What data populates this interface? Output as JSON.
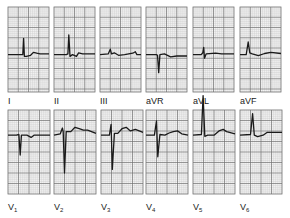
{
  "colors": {
    "paper": "#f4f4f4",
    "minor_grid": "#c8c8c8",
    "major_grid": "#6e6e6e",
    "trace": "#1a1a1a",
    "label": "#222222"
  },
  "rows": [
    {
      "leads": [
        {
          "id": "I",
          "label": "I",
          "sub": ""
        },
        {
          "id": "II",
          "label": "II",
          "sub": ""
        },
        {
          "id": "III",
          "label": "III",
          "sub": ""
        },
        {
          "id": "aVR",
          "label": "aVR",
          "sub": ""
        },
        {
          "id": "aVL",
          "label": "aVL",
          "sub": ""
        },
        {
          "id": "aVF",
          "label": "aVF",
          "sub": ""
        }
      ]
    },
    {
      "leads": [
        {
          "id": "V1",
          "label": "V",
          "sub": "1"
        },
        {
          "id": "V2",
          "label": "V",
          "sub": "2"
        },
        {
          "id": "V3",
          "label": "V",
          "sub": "3"
        },
        {
          "id": "V4",
          "label": "V",
          "sub": "4"
        },
        {
          "id": "V5",
          "label": "V",
          "sub": "5"
        },
        {
          "id": "V6",
          "label": "V",
          "sub": "6"
        }
      ]
    }
  ],
  "waveforms": {
    "I": [
      [
        0,
        0
      ],
      [
        0.3,
        0
      ],
      [
        0.36,
        0
      ],
      [
        0.38,
        0.45
      ],
      [
        0.4,
        -0.05
      ],
      [
        0.45,
        -0.05
      ],
      [
        0.55,
        -0.02
      ],
      [
        0.62,
        0.06
      ],
      [
        0.7,
        0.04
      ],
      [
        0.78,
        0.02
      ],
      [
        1,
        0.02
      ]
    ],
    "II": [
      [
        0,
        0
      ],
      [
        0.3,
        0
      ],
      [
        0.34,
        0.02
      ],
      [
        0.36,
        0.55
      ],
      [
        0.39,
        -0.05
      ],
      [
        0.45,
        0
      ],
      [
        0.55,
        -0.05
      ],
      [
        0.6,
        0.05
      ],
      [
        0.7,
        0.02
      ],
      [
        1,
        0.02
      ]
    ],
    "III": [
      [
        0,
        0
      ],
      [
        0.2,
        0.02
      ],
      [
        0.25,
        0.15
      ],
      [
        0.28,
        0.02
      ],
      [
        0.35,
        0.05
      ],
      [
        0.45,
        -0.02
      ],
      [
        0.6,
        0
      ],
      [
        0.8,
        0.04
      ],
      [
        0.86,
        0.08
      ],
      [
        0.9,
        0
      ],
      [
        1,
        0
      ]
    ],
    "aVR": [
      [
        0,
        0
      ],
      [
        0.25,
        0
      ],
      [
        0.28,
        -0.02
      ],
      [
        0.31,
        -0.5
      ],
      [
        0.34,
        0
      ],
      [
        0.45,
        0.02
      ],
      [
        0.6,
        -0.06
      ],
      [
        0.75,
        -0.04
      ],
      [
        1,
        -0.04
      ]
    ],
    "aVL": [
      [
        0,
        0
      ],
      [
        0.2,
        0
      ],
      [
        0.24,
        0.05
      ],
      [
        0.26,
        0.2
      ],
      [
        0.28,
        -0.1
      ],
      [
        0.32,
        0.02
      ],
      [
        0.55,
        0.04
      ],
      [
        0.7,
        0.02
      ],
      [
        1,
        0.02
      ]
    ],
    "aVF": [
      [
        0,
        0
      ],
      [
        0.15,
        0
      ],
      [
        0.2,
        0.35
      ],
      [
        0.24,
        0.05
      ],
      [
        0.3,
        0.02
      ],
      [
        0.45,
        -0.03
      ],
      [
        0.6,
        0.03
      ],
      [
        0.75,
        0.06
      ],
      [
        1,
        0.03
      ]
    ],
    "V1": [
      [
        0,
        0
      ],
      [
        0.2,
        0
      ],
      [
        0.26,
        0.02
      ],
      [
        0.29,
        -0.55
      ],
      [
        0.32,
        0
      ],
      [
        0.45,
        0
      ],
      [
        0.55,
        -0.06
      ],
      [
        0.62,
        0
      ],
      [
        1,
        0
      ]
    ],
    "V2": [
      [
        0,
        0
      ],
      [
        0.15,
        0.04
      ],
      [
        0.2,
        0.2
      ],
      [
        0.22,
        0.1
      ],
      [
        0.25,
        -1.05
      ],
      [
        0.29,
        0.1
      ],
      [
        0.4,
        0.1
      ],
      [
        0.5,
        0.22
      ],
      [
        0.6,
        0.18
      ],
      [
        0.7,
        0.14
      ],
      [
        0.8,
        0.14
      ],
      [
        1,
        0.05
      ]
    ],
    "V3": [
      [
        0,
        0
      ],
      [
        0.2,
        0
      ],
      [
        0.24,
        0.3
      ],
      [
        0.27,
        -0.95
      ],
      [
        0.32,
        0.05
      ],
      [
        0.4,
        0.05
      ],
      [
        0.5,
        0.18
      ],
      [
        0.6,
        0.22
      ],
      [
        0.7,
        0.12
      ],
      [
        0.82,
        0.16
      ],
      [
        1,
        0.08
      ]
    ],
    "V4": [
      [
        0,
        0
      ],
      [
        0.2,
        0
      ],
      [
        0.25,
        0.4
      ],
      [
        0.28,
        -0.6
      ],
      [
        0.33,
        0.02
      ],
      [
        0.45,
        0
      ],
      [
        0.55,
        0.06
      ],
      [
        0.65,
        0.1
      ],
      [
        0.75,
        0.12
      ],
      [
        0.85,
        0.04
      ],
      [
        1,
        0
      ]
    ],
    "V5": [
      [
        0,
        0
      ],
      [
        0.2,
        0.02
      ],
      [
        0.24,
        1.1
      ],
      [
        0.28,
        -0.03
      ],
      [
        0.35,
        0
      ],
      [
        0.5,
        0
      ],
      [
        0.62,
        0.12
      ],
      [
        0.72,
        0.16
      ],
      [
        0.8,
        0.1
      ],
      [
        1,
        0.04
      ]
    ],
    "V6": [
      [
        0,
        0
      ],
      [
        0.25,
        0.02
      ],
      [
        0.3,
        0.6
      ],
      [
        0.34,
        0
      ],
      [
        0.42,
        -0.04
      ],
      [
        0.55,
        0
      ],
      [
        0.65,
        0.08
      ],
      [
        0.8,
        0.08
      ],
      [
        1,
        0.08
      ]
    ]
  }
}
